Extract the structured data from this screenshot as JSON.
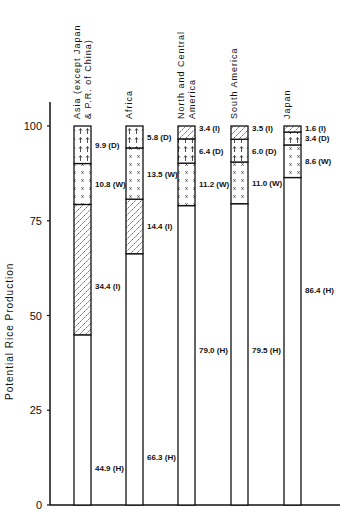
{
  "chart_data": {
    "type": "bar",
    "stacked": true,
    "title": "",
    "xlabel": "",
    "ylabel": "Potential Rice Production",
    "ylim": [
      0,
      105
    ],
    "yticks": [
      0,
      25,
      50,
      75,
      100
    ],
    "grid": false,
    "legend": "none (segment codes labeled inline: H, I, W, D)",
    "categories": [
      "Asia (except Japan & P.R. of China)",
      "Africa",
      "North and Central America",
      "South America",
      "Japan"
    ],
    "category_label_lines": [
      [
        "Asia (except Japan",
        "& P.R. of China)"
      ],
      [
        "Africa"
      ],
      [
        "North and Central",
        "America"
      ],
      [
        "South America"
      ],
      [
        "Japan"
      ]
    ],
    "series": [
      {
        "name": "H",
        "pattern": "blank",
        "values": [
          44.9,
          66.3,
          79.0,
          79.5,
          86.4
        ]
      },
      {
        "name": "I",
        "pattern": "diagonal hatch",
        "values": [
          34.4,
          14.4,
          3.4,
          3.5,
          1.6
        ]
      },
      {
        "name": "W",
        "pattern": "x marks",
        "values": [
          10.8,
          13.5,
          11.2,
          11.0,
          8.6
        ]
      },
      {
        "name": "D",
        "pattern": "arrows",
        "values": [
          9.9,
          5.8,
          6.4,
          6.0,
          3.4
        ]
      }
    ],
    "stack_order_bottom_to_top": [
      [
        "H",
        "I",
        "W",
        "D"
      ],
      [
        "H",
        "I",
        "W",
        "D"
      ],
      [
        "H",
        "W",
        "D",
        "I"
      ],
      [
        "H",
        "W",
        "D",
        "I"
      ],
      [
        "H",
        "W",
        "D",
        "I"
      ]
    ],
    "segment_labels": [
      [
        "44.9 (H)",
        "34.4 (I)",
        "10.8 (W)",
        "9.9 (D)"
      ],
      [
        "66.3 (H)",
        "14.4 (I)",
        "13.5 (W)",
        "5.8 (D)"
      ],
      [
        "79.0 (H)",
        "11.2 (W)",
        "6.4 (D)",
        "3.4 (I)"
      ],
      [
        "79.5 (H)",
        "11.0 (W)",
        "6.0 (D)",
        "3.5 (I)"
      ],
      [
        "86.4 (H)",
        "8.6 (W)",
        "3.4 (D)",
        "1.6 (I)"
      ]
    ]
  }
}
